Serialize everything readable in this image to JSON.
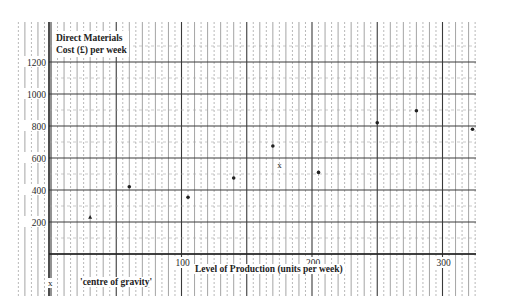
{
  "chart_data": {
    "type": "scatter",
    "title": "",
    "ylabel": "Direct Materials Cost (£) per week",
    "ylabel_line1": "Direct Materials",
    "ylabel_line2": "Cost (£) per week",
    "xlabel": "Level of Production (units per week)",
    "xlim": [
      0,
      330
    ],
    "ylim": [
      0,
      1300
    ],
    "x_ticks": [
      100,
      200,
      300
    ],
    "x_tick_labels": [
      "100",
      "200",
      "300"
    ],
    "y_ticks": [
      200,
      400,
      600,
      800,
      1000,
      1200
    ],
    "y_tick_labels": [
      "200",
      "400",
      "600",
      "800",
      "1000",
      "1200"
    ],
    "grid": true,
    "legend": null,
    "series": [
      {
        "name": "Observations",
        "marker": "dot",
        "points": [
          {
            "x": 30,
            "y": 230
          },
          {
            "x": 60,
            "y": 420
          },
          {
            "x": 105,
            "y": 355
          },
          {
            "x": 140,
            "y": 475
          },
          {
            "x": 170,
            "y": 675
          },
          {
            "x": 205,
            "y": 510
          },
          {
            "x": 250,
            "y": 820
          },
          {
            "x": 280,
            "y": 895
          },
          {
            "x": 323,
            "y": 780
          }
        ]
      },
      {
        "name": "Centre of gravity",
        "marker": "x",
        "points": [
          {
            "x": 175,
            "y": 555
          }
        ]
      }
    ],
    "annotations": [
      {
        "text": "x",
        "role": "legend-marker"
      },
      {
        "text": "'centre of gravity'",
        "role": "legend-label"
      }
    ]
  },
  "labels": {
    "ylabel_line1": "Direct Materials",
    "ylabel_line2": "Cost (£) per week",
    "xlabel": "Level of Production (units per week)",
    "cog_marker": "x",
    "cog_label": "'centre of gravity'"
  },
  "colors": {
    "ink": "#2a2a2a",
    "grid_major": "#3a3a3a",
    "grid_minor": "#8a8a8a",
    "background": "#ffffff"
  }
}
